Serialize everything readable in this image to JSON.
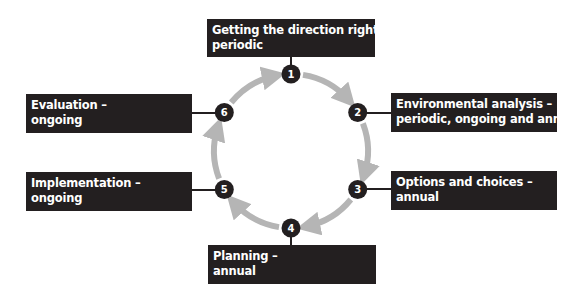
{
  "diagram": {
    "type": "cycle",
    "direction": "clockwise",
    "colors": {
      "box_fill": "#231f20",
      "box_text": "#ffffff",
      "node_fill": "#231f20",
      "arrow": "#b5b5b5",
      "connector": "#231f20"
    },
    "stages": [
      {
        "number": "1",
        "title": "Getting the direction right –",
        "frequency": "periodic"
      },
      {
        "number": "2",
        "title": "Environmental analysis –",
        "frequency": "periodic, ongoing and annual"
      },
      {
        "number": "3",
        "title": "Options and choices –",
        "frequency": "annual"
      },
      {
        "number": "4",
        "title": "Planning –",
        "frequency": "annual"
      },
      {
        "number": "5",
        "title": "Implementation –",
        "frequency": "ongoing"
      },
      {
        "number": "6",
        "title": "Evaluation –",
        "frequency": "ongoing"
      }
    ]
  }
}
